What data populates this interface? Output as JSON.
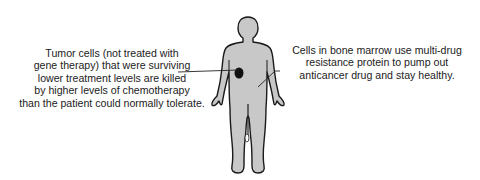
{
  "figure": {
    "colors": {
      "body_fill": "#c8c8c8",
      "outline": "#1a1a1a",
      "tumor": "#111111",
      "text": "#222222"
    }
  },
  "annotations": {
    "left": {
      "lines": [
        "Tumor cells (not treated with",
        "gene therapy) that were surviving",
        "lower treatment levels are killed",
        "by higher levels of chemotherapy",
        "than the patient could normally tolerate."
      ]
    },
    "right": {
      "lines": [
        "Cells in bone marrow use multi-drug",
        "resistance protein to pump out",
        "anticancer drug and stay healthy."
      ]
    }
  }
}
